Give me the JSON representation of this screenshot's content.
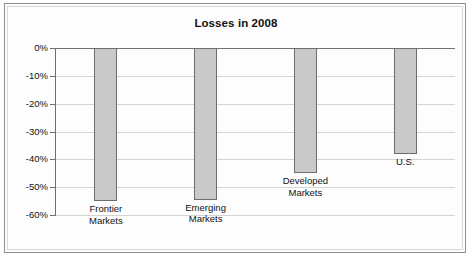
{
  "chart_data": {
    "type": "bar",
    "title": "Losses in 2008",
    "xlabel": "",
    "ylabel": "",
    "ylim": [
      -60,
      0
    ],
    "grid": true,
    "legend": "none",
    "value_suffix": "%",
    "categories": [
      "Frontier Markets",
      "Emerging Markets",
      "Developed Markets",
      "U.S."
    ],
    "values": [
      -55,
      -54.5,
      -45,
      -38
    ],
    "ytick_labels": [
      "0%",
      "-10%",
      "-20%",
      "-30%",
      "-40%",
      "-50%",
      "-60%"
    ],
    "ytick_values": [
      0,
      -10,
      -20,
      -30,
      -40,
      -50,
      -60
    ],
    "bars": [
      {
        "label_line1": "Frontier",
        "label_line2": "Markets",
        "value": -55
      },
      {
        "label_line1": "Emerging",
        "label_line2": "Markets",
        "value": -54.5
      },
      {
        "label_line1": "Developed",
        "label_line2": "Markets",
        "value": -45
      },
      {
        "label_line1": "U.S.",
        "label_line2": "",
        "value": -38
      }
    ],
    "colors": {
      "bar_fill": "#c9c9c9",
      "bar_stroke": "#6d6d6d",
      "gridline": "#d4d4d4",
      "axis": "#6f6f6f",
      "text": "#111111",
      "background": "#ffffff",
      "frame": "#8e8e8e"
    }
  }
}
